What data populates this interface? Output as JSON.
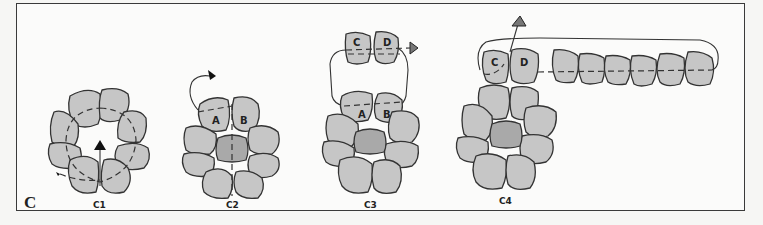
{
  "figure": {
    "panel_label": "C",
    "colors": {
      "cell": "#c6c6c6",
      "cell_central": "#a9a9a9",
      "outline": "#333333",
      "background": "#fbfbfa"
    },
    "stages": [
      {
        "id": "C1",
        "label": "C1",
        "description": "ring of cells with central upward arrow"
      },
      {
        "id": "C2",
        "label": "C2",
        "cell_labels": [
          "A",
          "B"
        ],
        "description": "cells A and B split off with curved arrow"
      },
      {
        "id": "C3",
        "label": "C3",
        "cell_labels": [
          "C",
          "D",
          "A",
          "B"
        ],
        "description": "cells C and D separated above A and B, arrow to right"
      },
      {
        "id": "C4",
        "label": "C4",
        "cell_labels": [
          "C",
          "D"
        ],
        "description": "chain of cells extending right from C and D, arrow up"
      }
    ]
  }
}
